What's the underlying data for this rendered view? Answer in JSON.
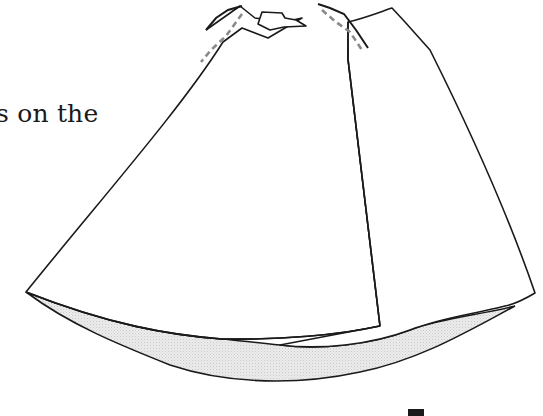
{
  "caption": {
    "text": "s on the"
  },
  "figure": {
    "colors": {
      "line": "#1a1a1a",
      "lining_fill": "#e6e6e6",
      "stitch": "#8a8a8a"
    }
  },
  "footer_fragment": {
    "text": ""
  }
}
